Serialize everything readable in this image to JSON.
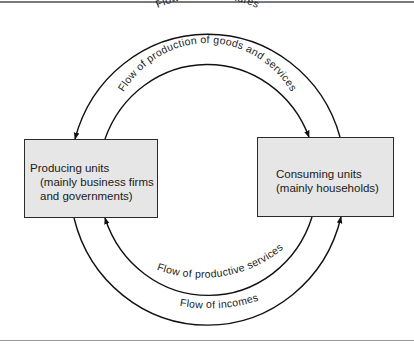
{
  "diagram": {
    "boxes": {
      "producing": {
        "title": "Producing units",
        "subtitle": "(mainly business firms and governments)",
        "fill": "#e6e6e6"
      },
      "consuming": {
        "title": "Consuming units",
        "subtitle": "(mainly households)",
        "fill": "#e6e6e6"
      }
    },
    "flows": [
      {
        "label": "Flow of expenditures",
        "from": "consuming",
        "to": "producing",
        "position": "outer-top"
      },
      {
        "label": "Flow of production of goods and services",
        "from": "producing",
        "to": "consuming",
        "position": "inner-top"
      },
      {
        "label": "Flow of productive services",
        "from": "consuming",
        "to": "producing",
        "position": "inner-bottom"
      },
      {
        "label": "Flow of incomes",
        "from": "producing",
        "to": "consuming",
        "position": "outer-bottom"
      }
    ]
  }
}
